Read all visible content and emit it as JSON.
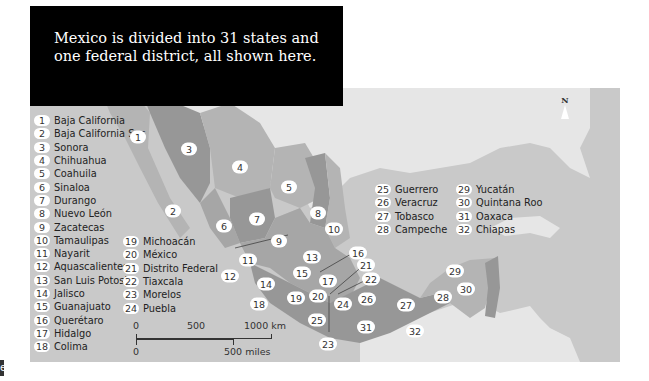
{
  "caption": "Mexico is divided into 31 states and one federal district, all shown here.",
  "compass_label": "N",
  "edge_tab_label": "e",
  "legend_columns": [
    [
      {
        "num": "1",
        "name": "Baja California"
      },
      {
        "num": "2",
        "name": "Baja California Sur"
      },
      {
        "num": "3",
        "name": "Sonora"
      },
      {
        "num": "4",
        "name": "Chihuahua"
      },
      {
        "num": "5",
        "name": "Coahuila"
      },
      {
        "num": "6",
        "name": "Sinaloa"
      },
      {
        "num": "7",
        "name": "Durango"
      },
      {
        "num": "8",
        "name": "Nuevo León"
      },
      {
        "num": "9",
        "name": "Zacatecas"
      },
      {
        "num": "10",
        "name": "Tamaulipas"
      },
      {
        "num": "11",
        "name": "Nayarit"
      },
      {
        "num": "12",
        "name": "Aquascalientes"
      },
      {
        "num": "13",
        "name": "San Luis Potosi"
      },
      {
        "num": "14",
        "name": "Jalisco"
      },
      {
        "num": "15",
        "name": "Guanajuato"
      },
      {
        "num": "16",
        "name": "Querétaro"
      },
      {
        "num": "17",
        "name": "Hidalgo"
      },
      {
        "num": "18",
        "name": "Colima"
      }
    ],
    [
      {
        "num": "19",
        "name": "Michoacán"
      },
      {
        "num": "20",
        "name": "México"
      },
      {
        "num": "21",
        "name": "Distrito Federal"
      },
      {
        "num": "22",
        "name": "Tiaxcala"
      },
      {
        "num": "23",
        "name": "Morelos"
      },
      {
        "num": "24",
        "name": "Puebla"
      }
    ],
    [
      {
        "num": "25",
        "name": "Guerrero"
      },
      {
        "num": "26",
        "name": "Veracruz"
      },
      {
        "num": "27",
        "name": "Tobasco"
      },
      {
        "num": "28",
        "name": "Campeche"
      }
    ],
    [
      {
        "num": "29",
        "name": "Yucatán"
      },
      {
        "num": "30",
        "name": "Quintana Roo"
      },
      {
        "num": "31",
        "name": "Oaxaca"
      },
      {
        "num": "32",
        "name": "Chiapas"
      }
    ]
  ],
  "scale": {
    "km_ticks": [
      "0",
      "500",
      "1000 km"
    ],
    "mile_ticks": [
      "0",
      "500 miles"
    ]
  },
  "map_badges": [
    "1",
    "2",
    "3",
    "4",
    "5",
    "6",
    "7",
    "8",
    "9",
    "10",
    "11",
    "12",
    "13",
    "14",
    "15",
    "16",
    "17",
    "18",
    "19",
    "20",
    "21",
    "22",
    "23",
    "24",
    "25",
    "26",
    "27",
    "28",
    "29",
    "30",
    "31",
    "32"
  ],
  "colors": {
    "sea": "#c9c9c9",
    "land_other": "#e6e6e6",
    "state_light": "#b4b4b4",
    "state_mid": "#a6a6a6",
    "state_dark": "#979797",
    "caption_bg": "#000000"
  }
}
